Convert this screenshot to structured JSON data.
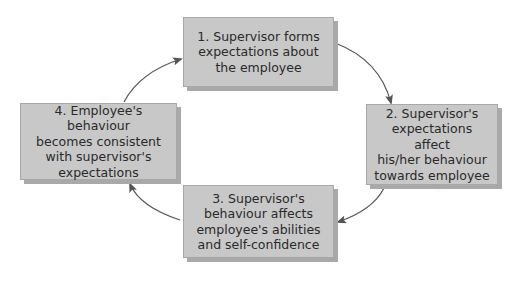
{
  "diagram": {
    "type": "cycle",
    "steps": [
      {
        "id": 1,
        "label": "1. Supervisor forms expectations about the employee",
        "lines": [
          "1. Supervisor forms",
          "expectations about",
          "the employee"
        ]
      },
      {
        "id": 2,
        "label": "2. Supervisor's expectations affect his/her behaviour towards employee",
        "lines": [
          "2. Supervisor's",
          "expectations affect",
          "his/her behaviour",
          "towards employee"
        ]
      },
      {
        "id": 3,
        "label": "3. Supervisor's behaviour affects employee's abilities and self-confidence",
        "lines": [
          "3. Supervisor's",
          "behaviour affects",
          "employee's abilities",
          "and self-confidence"
        ]
      },
      {
        "id": 4,
        "label": "4. Employee's behaviour becomes consistent with supervisor's expectations",
        "lines": [
          "4. Employee's behaviour",
          "becomes consistent",
          "with supervisor's",
          "expectations"
        ]
      }
    ],
    "arrows": [
      {
        "from": 1,
        "to": 2
      },
      {
        "from": 2,
        "to": 3
      },
      {
        "from": 3,
        "to": 4
      },
      {
        "from": 4,
        "to": 1
      }
    ],
    "colors": {
      "box_fill": "#c8c8c8",
      "box_shadow": "#a9a9a9",
      "arrow": "#555555",
      "text": "#2a2a2a"
    }
  }
}
